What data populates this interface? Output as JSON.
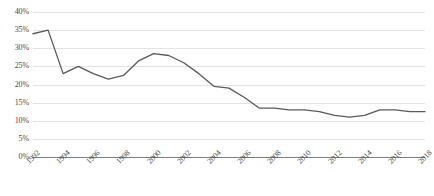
{
  "chart_data": {
    "type": "line",
    "title": "",
    "subtitle": "",
    "xlabel": "",
    "ylabel": "",
    "grid": true,
    "legend": false,
    "legend_position": "none",
    "line_color": "#595959",
    "x": [
      1992,
      1993,
      1994,
      1995,
      1996,
      1997,
      1998,
      1999,
      2000,
      2001,
      2002,
      2003,
      2004,
      2005,
      2006,
      2007,
      2008,
      2009,
      2010,
      2011,
      2012,
      2013,
      2014,
      2015,
      2016,
      2017,
      2018
    ],
    "values": [
      34.0,
      35.0,
      23.0,
      25.0,
      23.0,
      21.5,
      22.5,
      26.5,
      28.5,
      28.0,
      26.0,
      23.0,
      19.5,
      19.0,
      16.5,
      13.5,
      13.5,
      13.0,
      13.0,
      12.5,
      11.5,
      11.0,
      11.5,
      13.0,
      13.0,
      12.5,
      12.5
    ],
    "series": [
      {
        "name": "Series 1",
        "values": [
          34.0,
          35.0,
          23.0,
          25.0,
          23.0,
          21.5,
          22.5,
          26.5,
          28.5,
          28.0,
          26.0,
          23.0,
          19.5,
          19.0,
          16.5,
          13.5,
          13.5,
          13.0,
          13.0,
          12.5,
          11.5,
          11.0,
          11.5,
          13.0,
          13.0,
          12.5,
          12.5
        ]
      }
    ],
    "ylim": [
      0,
      40
    ],
    "xlim": [
      1992,
      2018
    ],
    "y_ticks": [
      0,
      5,
      10,
      15,
      20,
      25,
      30,
      35,
      40
    ],
    "y_tick_labels": [
      "0%",
      "5%",
      "10%",
      "15%",
      "20%",
      "25%",
      "30%",
      "35%",
      "40%"
    ],
    "x_ticks": [
      1992,
      1994,
      1996,
      1998,
      2000,
      2002,
      2004,
      2006,
      2008,
      2010,
      2012,
      2014,
      2016,
      2018
    ],
    "x_tick_labels": [
      "1992",
      "1994",
      "1996",
      "1998",
      "2000",
      "2002",
      "2004",
      "2006",
      "2008",
      "2010",
      "2012",
      "2014",
      "2016",
      "2018"
    ]
  }
}
